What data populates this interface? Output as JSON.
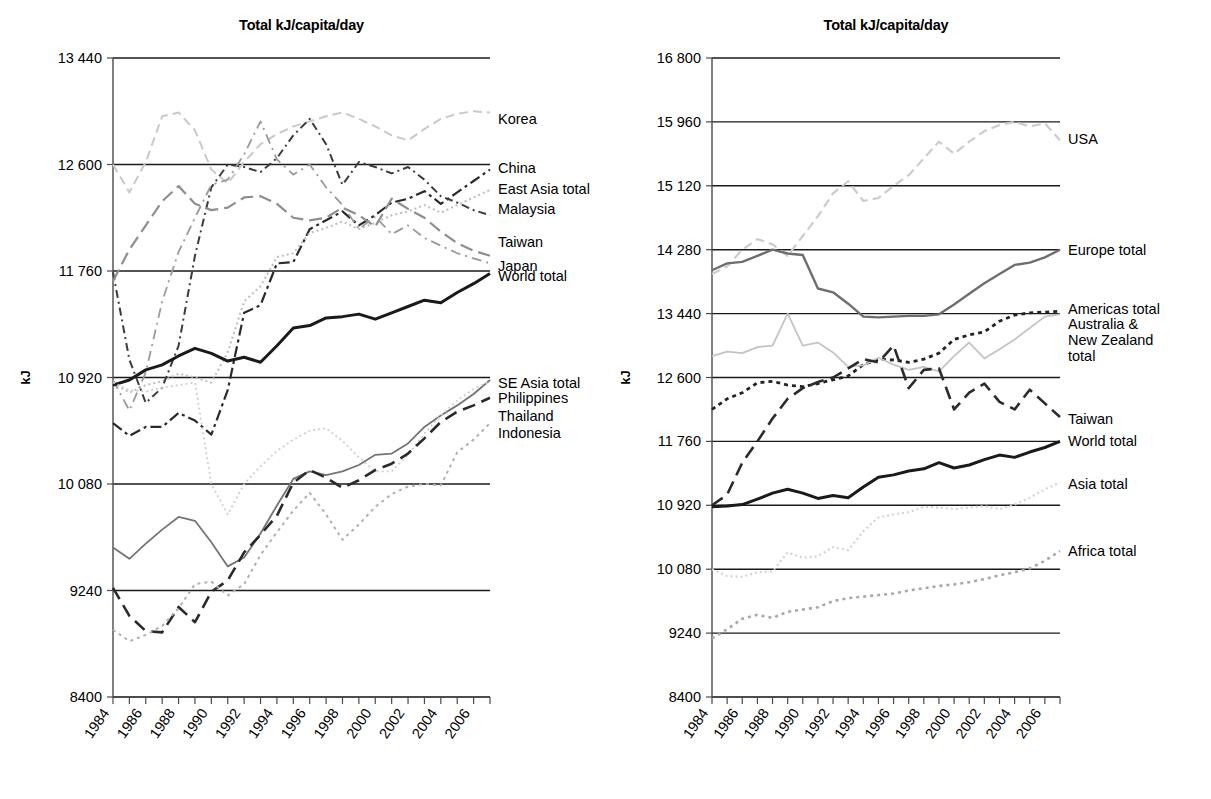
{
  "figure": {
    "panels": [
      "left",
      "right"
    ]
  },
  "chart_data": [
    {
      "panel": "left",
      "type": "line",
      "title": "Total kJ/capita/day",
      "xlabel": "",
      "ylabel": "kJ",
      "xlim": [
        1984,
        2007
      ],
      "ylim": [
        8400,
        13440
      ],
      "ytick_labels": [
        "8400",
        "9240",
        "10 080",
        "10 920",
        "11 760",
        "12 600",
        "13 440"
      ],
      "yticks": [
        8400,
        9240,
        10080,
        10920,
        11760,
        12600,
        13440
      ],
      "xticks": [
        1984,
        1985,
        1986,
        1987,
        1988,
        1989,
        1990,
        1991,
        1992,
        1993,
        1994,
        1995,
        1996,
        1997,
        1998,
        1999,
        2000,
        2001,
        2002,
        2003,
        2004,
        2005,
        2006,
        2007
      ],
      "xtick_labels": [
        "1984",
        "1986",
        "1988",
        "1990",
        "1992",
        "1994",
        "1996",
        "1998",
        "2000",
        "2002",
        "2004",
        "2006"
      ],
      "xtick_label_years": [
        1984,
        1986,
        1988,
        1990,
        1992,
        1994,
        1996,
        1998,
        2000,
        2002,
        2004,
        2006
      ],
      "grid": true,
      "legend_position": "right-inline",
      "x": [
        1984,
        1985,
        1986,
        1987,
        1988,
        1989,
        1990,
        1991,
        1992,
        1993,
        1994,
        1995,
        1996,
        1997,
        1998,
        1999,
        2000,
        2001,
        2002,
        2003,
        2004,
        2005,
        2006,
        2007
      ],
      "series": [
        {
          "name": "Korea",
          "label": "Korea",
          "color": "#c9c9c9",
          "dash": "9,5",
          "width": 2.0,
          "label_y": 12960,
          "values": [
            12600,
            12380,
            12620,
            12980,
            13010,
            12870,
            12560,
            12450,
            12620,
            12760,
            12840,
            12900,
            12940,
            12980,
            13010,
            12960,
            12900,
            12830,
            12790,
            12880,
            12960,
            13000,
            13020,
            13010
          ]
        },
        {
          "name": "China",
          "label": "China",
          "color": "#2a2a2a",
          "dash": "11,4,3,4",
          "width": 2.2,
          "label_y": 12570,
          "values": [
            10560,
            10460,
            10530,
            10530,
            10640,
            10580,
            10470,
            10820,
            11430,
            11490,
            11820,
            11830,
            12090,
            12160,
            12230,
            12120,
            12200,
            12300,
            12330,
            12390,
            12290,
            12380,
            12470,
            12560
          ]
        },
        {
          "name": "East Asia total",
          "label": "East Asia total",
          "color": "#bdbdbd",
          "dash": "2,3",
          "width": 2.0,
          "label_y": 12410,
          "values": [
            10880,
            10800,
            10860,
            10890,
            10950,
            10920,
            10880,
            11120,
            11520,
            11640,
            11870,
            11900,
            12060,
            12100,
            12150,
            12090,
            12140,
            12200,
            12230,
            12280,
            12220,
            12280,
            12340,
            12400
          ]
        },
        {
          "name": "Malaysia",
          "label": "Malaysia",
          "color": "#3c3c3c",
          "dash": "8,4,2,4",
          "width": 2.0,
          "label_y": 12250,
          "values": [
            11750,
            11060,
            10720,
            10840,
            11170,
            11880,
            12420,
            12600,
            12580,
            12540,
            12650,
            12830,
            12960,
            12760,
            12440,
            12620,
            12580,
            12530,
            12580,
            12480,
            12350,
            12300,
            12240,
            12200
          ]
        },
        {
          "name": "Taiwan",
          "label": "Taiwan",
          "color": "#8e8e8e",
          "dash": "13,6",
          "width": 2.2,
          "label_y": 11990,
          "values": [
            11680,
            11930,
            12120,
            12310,
            12430,
            12290,
            12240,
            12260,
            12340,
            12350,
            12290,
            12180,
            12160,
            12180,
            12260,
            12200,
            12110,
            12330,
            12250,
            12180,
            12070,
            11980,
            11920,
            11880
          ]
        },
        {
          "name": "Japan",
          "label": "Japan",
          "color": "#9a9a9a",
          "dash": "10,5,2,5",
          "width": 1.8,
          "label_y": 11800,
          "values": [
            10900,
            10660,
            10960,
            11520,
            11910,
            12180,
            12440,
            12480,
            12680,
            12940,
            12640,
            12520,
            12600,
            12420,
            12280,
            12090,
            12190,
            12050,
            12120,
            12020,
            11960,
            11900,
            11860,
            11820
          ]
        },
        {
          "name": "World total",
          "label": "World total",
          "color": "#1a1a1a",
          "dash": "",
          "width": 3.0,
          "label_y": 11720,
          "values": [
            10860,
            10900,
            10980,
            11020,
            11090,
            11150,
            11110,
            11050,
            11080,
            11040,
            11170,
            11310,
            11330,
            11390,
            11400,
            11420,
            11380,
            11430,
            11480,
            11530,
            11510,
            11590,
            11660,
            11740
          ]
        },
        {
          "name": "SE Asia total",
          "label": "SE Asia total",
          "color": "#747474",
          "dash": "",
          "width": 1.8,
          "label_y": 10880,
          "values": [
            9580,
            9490,
            9610,
            9720,
            9820,
            9790,
            9620,
            9430,
            9500,
            9690,
            9910,
            10120,
            10180,
            10150,
            10180,
            10230,
            10310,
            10320,
            10400,
            10530,
            10620,
            10700,
            10790,
            10900
          ]
        },
        {
          "name": "Philippines",
          "label": "Philippines",
          "color": "#cfcfcf",
          "dash": "2,3",
          "width": 1.8,
          "label_y": 10760,
          "values": [
            10880,
            10820,
            10810,
            10840,
            10860,
            10880,
            10080,
            9840,
            10080,
            10220,
            10340,
            10430,
            10500,
            10520,
            10420,
            10290,
            10180,
            10180,
            10310,
            10480,
            10620,
            10740,
            10830,
            10890
          ]
        },
        {
          "name": "Thailand",
          "label": "Thailand",
          "color": "#2a2a2a",
          "dash": "13,7",
          "width": 2.6,
          "label_y": 10620,
          "values": [
            9260,
            9040,
            8920,
            8910,
            9110,
            8990,
            9230,
            9320,
            9540,
            9680,
            9830,
            10090,
            10190,
            10130,
            10050,
            10110,
            10190,
            10240,
            10320,
            10440,
            10570,
            10650,
            10700,
            10760
          ]
        },
        {
          "name": "Indonesia",
          "label": "Indonesia",
          "color": "#b0b0b0",
          "dash": "3,4",
          "width": 2.0,
          "label_y": 10480,
          "values": [
            8930,
            8840,
            8890,
            8960,
            9100,
            9290,
            9310,
            9200,
            9290,
            9520,
            9700,
            9870,
            10010,
            9840,
            9640,
            9760,
            9900,
            10000,
            10060,
            10080,
            10070,
            10330,
            10430,
            10560
          ]
        }
      ]
    },
    {
      "panel": "right",
      "type": "line",
      "title": "Total kJ/capita/day",
      "xlabel": "",
      "ylabel": "kJ",
      "xlim": [
        1984,
        2007
      ],
      "ylim": [
        8400,
        16800
      ],
      "ytick_labels": [
        "8400",
        "9240",
        "10 080",
        "10 920",
        "11 760",
        "12 600",
        "13 440",
        "14 280",
        "15 120",
        "15 960",
        "16 800"
      ],
      "yticks": [
        8400,
        9240,
        10080,
        10920,
        11760,
        12600,
        13440,
        14280,
        15120,
        15960,
        16800
      ],
      "xticks": [
        1984,
        1985,
        1986,
        1987,
        1988,
        1989,
        1990,
        1991,
        1992,
        1993,
        1994,
        1995,
        1996,
        1997,
        1998,
        1999,
        2000,
        2001,
        2002,
        2003,
        2004,
        2005,
        2006,
        2007
      ],
      "xtick_labels": [
        "1984",
        "1986",
        "1988",
        "1990",
        "1992",
        "1994",
        "1996",
        "1998",
        "2000",
        "2002",
        "2004",
        "2006"
      ],
      "xtick_label_years": [
        1984,
        1986,
        1988,
        1990,
        1992,
        1994,
        1996,
        1998,
        2000,
        2002,
        2004,
        2006
      ],
      "grid": true,
      "legend_position": "right-inline",
      "x": [
        1984,
        1985,
        1986,
        1987,
        1988,
        1989,
        1990,
        1991,
        1992,
        1993,
        1994,
        1995,
        1996,
        1997,
        1998,
        1999,
        2000,
        2001,
        2002,
        2003,
        2004,
        2005,
        2006,
        2007
      ],
      "series": [
        {
          "name": "USA",
          "label": "USA",
          "color": "#cccccc",
          "dash": "9,5",
          "width": 2.2,
          "label_y": 15730,
          "values": [
            13960,
            14060,
            14280,
            14420,
            14350,
            14200,
            14460,
            14720,
            15020,
            15180,
            14920,
            14960,
            15120,
            15260,
            15480,
            15700,
            15540,
            15700,
            15840,
            15920,
            15960,
            15900,
            15940,
            15720
          ]
        },
        {
          "name": "Europe total",
          "label": "Europe total",
          "color": "#6e6e6e",
          "dash": "",
          "width": 2.4,
          "label_y": 14280,
          "values": [
            14010,
            14100,
            14120,
            14200,
            14280,
            14230,
            14210,
            13770,
            13720,
            13570,
            13400,
            13390,
            13400,
            13410,
            13410,
            13430,
            13560,
            13700,
            13840,
            13960,
            14080,
            14110,
            14180,
            14280
          ]
        },
        {
          "name": "Americas total",
          "label": "Americas total",
          "color": "#232323",
          "dash": "4,4",
          "width": 2.8,
          "label_y": 13500,
          "values": [
            12180,
            12320,
            12400,
            12530,
            12550,
            12500,
            12480,
            12520,
            12570,
            12620,
            12770,
            12840,
            12830,
            12800,
            12840,
            12920,
            13100,
            13160,
            13200,
            13340,
            13420,
            13450,
            13460,
            13470
          ]
        },
        {
          "name": "Australia & New Zealand total",
          "label": "Australia &\nNew Zealand\ntotal",
          "color": "#c4c4c4",
          "dash": "",
          "width": 1.8,
          "label_y": 13300,
          "values": [
            12880,
            12940,
            12920,
            13000,
            13020,
            13440,
            13020,
            13060,
            12930,
            12740,
            12760,
            12860,
            12770,
            12700,
            12740,
            12680,
            12880,
            13060,
            12850,
            12970,
            13100,
            13250,
            13400,
            13430
          ]
        },
        {
          "name": "Taiwan",
          "label": "Taiwan",
          "color": "#2b2b2b",
          "dash": "13,7",
          "width": 2.6,
          "label_y": 12060,
          "values": [
            10920,
            11060,
            11480,
            11760,
            12060,
            12320,
            12460,
            12540,
            12600,
            12720,
            12840,
            12800,
            13020,
            12460,
            12700,
            12720,
            12180,
            12400,
            12520,
            12280,
            12180,
            12440,
            12260,
            12080
          ]
        },
        {
          "name": "World total",
          "label": "World total",
          "color": "#1a1a1a",
          "dash": "",
          "width": 3.0,
          "label_y": 11760,
          "values": [
            10900,
            10910,
            10930,
            11000,
            11080,
            11130,
            11080,
            11010,
            11050,
            11020,
            11160,
            11290,
            11320,
            11370,
            11400,
            11480,
            11410,
            11450,
            11520,
            11580,
            11550,
            11620,
            11680,
            11760
          ]
        },
        {
          "name": "Asia total",
          "label": "Asia total",
          "color": "#d4d4d4",
          "dash": "2,3",
          "width": 2.2,
          "label_y": 11200,
          "values": [
            10080,
            9990,
            9980,
            10040,
            10050,
            10300,
            10230,
            10250,
            10370,
            10330,
            10580,
            10760,
            10800,
            10830,
            10900,
            10890,
            10870,
            10890,
            10910,
            10870,
            10930,
            11020,
            11130,
            11220
          ]
        },
        {
          "name": "Africa total",
          "label": "Africa total",
          "color": "#a8a8a8",
          "dash": "3,4",
          "width": 2.6,
          "label_y": 10320,
          "values": [
            9170,
            9290,
            9430,
            9480,
            9440,
            9520,
            9550,
            9580,
            9660,
            9700,
            9720,
            9740,
            9760,
            9800,
            9830,
            9860,
            9880,
            9910,
            9950,
            10000,
            10040,
            10090,
            10190,
            10320
          ]
        }
      ]
    }
  ]
}
